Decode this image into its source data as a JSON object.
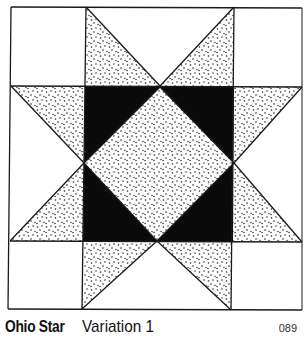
{
  "pattern": {
    "title": "Ohio Star",
    "variation": "Variation 1",
    "page_number": "089"
  },
  "colors": {
    "line": "#1a1a1a",
    "dark_fill": "#0a0a0a",
    "background_fill": "#ffffff",
    "stipple_dot": "#222222"
  },
  "block": {
    "grid": "3x3 nine-patch",
    "corner_squares": "white",
    "edge_squares": "two stippled star-point triangles each",
    "center_square": "black with stippled inset diamond"
  }
}
